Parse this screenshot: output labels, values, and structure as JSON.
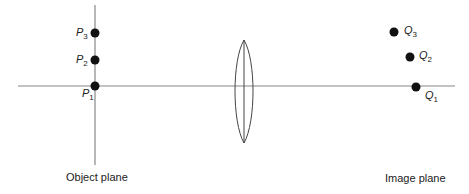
{
  "diagram": {
    "type": "optics-imaging",
    "axis": {
      "y": 86,
      "x_start": 18,
      "x_end": 455,
      "color": "#888888"
    },
    "object_plane": {
      "x": 95,
      "y_start": 5,
      "y_end": 165,
      "label": "Object plane"
    },
    "image_plane": {
      "label": "Image plane"
    },
    "lens": {
      "cx": 244,
      "cy": 91,
      "rx": 12,
      "ry": 52,
      "color": "#444444"
    },
    "object_points": [
      {
        "name": "P",
        "sub": "3",
        "x": 95,
        "y": 33
      },
      {
        "name": "P",
        "sub": "2",
        "x": 95,
        "y": 60
      },
      {
        "name": "P",
        "sub": "1",
        "x": 95,
        "y": 86
      }
    ],
    "image_points": [
      {
        "name": "Q",
        "sub": "3",
        "x": 394,
        "y": 32
      },
      {
        "name": "Q",
        "sub": "2",
        "x": 410,
        "y": 57
      },
      {
        "name": "Q",
        "sub": "1",
        "x": 416,
        "y": 87
      }
    ]
  }
}
